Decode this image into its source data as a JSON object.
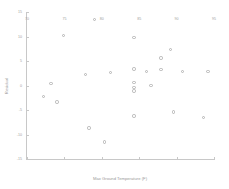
{
  "chart_data": {
    "type": "scatter",
    "title": "",
    "xlabel": "Max Ground Temperature (F)",
    "ylabel": "Residual",
    "xlim": [
      70,
      95
    ],
    "ylim": [
      -15,
      15
    ],
    "xticks": [
      70,
      75,
      80,
      85,
      90,
      95
    ],
    "yticks": [
      15,
      10,
      5,
      0,
      -5,
      -10,
      -15
    ],
    "grid": false,
    "legend": null,
    "marker": "open-circle",
    "marker_color": "#b4b4b4",
    "series": [
      {
        "name": "Residuals",
        "points": [
          {
            "x": 79.0,
            "y": 13.5
          },
          {
            "x": 74.9,
            "y": 10.2
          },
          {
            "x": 84.3,
            "y": 9.8
          },
          {
            "x": 89.2,
            "y": 7.3
          },
          {
            "x": 87.9,
            "y": 5.6
          },
          {
            "x": 84.3,
            "y": 3.4
          },
          {
            "x": 87.9,
            "y": 3.3
          },
          {
            "x": 86.0,
            "y": 2.9
          },
          {
            "x": 90.8,
            "y": 2.8
          },
          {
            "x": 94.2,
            "y": 2.8
          },
          {
            "x": 81.2,
            "y": 2.6
          },
          {
            "x": 77.8,
            "y": 2.3
          },
          {
            "x": 84.3,
            "y": 0.6
          },
          {
            "x": 73.2,
            "y": 0.4
          },
          {
            "x": 86.6,
            "y": 0.0
          },
          {
            "x": 84.3,
            "y": -0.4
          },
          {
            "x": 84.3,
            "y": -1.1
          },
          {
            "x": 72.2,
            "y": -2.3
          },
          {
            "x": 74.0,
            "y": -3.4
          },
          {
            "x": 89.6,
            "y": -5.4
          },
          {
            "x": 93.6,
            "y": -6.5
          },
          {
            "x": 84.3,
            "y": -6.2
          },
          {
            "x": 78.3,
            "y": -8.7
          },
          {
            "x": 80.4,
            "y": -11.5
          }
        ]
      }
    ]
  }
}
